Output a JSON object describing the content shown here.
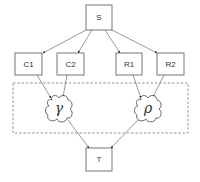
{
  "diagram": {
    "nodes": {
      "source": {
        "label": "S"
      },
      "c1": {
        "label": "C1"
      },
      "c2": {
        "label": "C2"
      },
      "r1": {
        "label": "R1"
      },
      "r2": {
        "label": "R2"
      },
      "gamma": {
        "label": "γ"
      },
      "rho": {
        "label": "ρ"
      },
      "target": {
        "label": "T"
      }
    },
    "edges": [
      {
        "from": "S",
        "to": "C1"
      },
      {
        "from": "S",
        "to": "C2"
      },
      {
        "from": "S",
        "to": "R1"
      },
      {
        "from": "S",
        "to": "R2"
      },
      {
        "from": "C1",
        "to": "γ"
      },
      {
        "from": "C2",
        "to": "γ"
      },
      {
        "from": "R1",
        "to": "ρ"
      },
      {
        "from": "R2",
        "to": "ρ"
      },
      {
        "from": "γ",
        "to": "T"
      },
      {
        "from": "ρ",
        "to": "T"
      }
    ],
    "group": {
      "style": "dashed",
      "contains": [
        "γ",
        "ρ"
      ]
    },
    "colors": {
      "stroke": "#555555",
      "background": "#ffffff"
    }
  }
}
